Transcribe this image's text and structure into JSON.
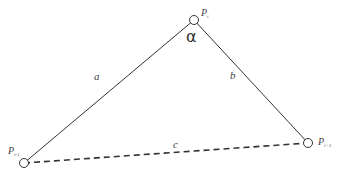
{
  "diagram": {
    "type": "triangle",
    "vertices": [
      {
        "id": "top",
        "label": "P",
        "subscript": "i",
        "x": 194,
        "y": 20
      },
      {
        "id": "left",
        "label": "P",
        "subscript": "i-1",
        "x": 24,
        "y": 163
      },
      {
        "id": "right",
        "label": "P",
        "subscript": "i+1",
        "x": 308,
        "y": 143
      }
    ],
    "edges": [
      {
        "id": "a",
        "label": "a",
        "from": "left",
        "to": "top",
        "style": "solid"
      },
      {
        "id": "b",
        "label": "b",
        "from": "top",
        "to": "right",
        "style": "solid"
      },
      {
        "id": "c",
        "label": "c",
        "from": "left",
        "to": "right",
        "style": "dashed"
      }
    ],
    "angle_label": "α",
    "colors": {
      "line": "#333333",
      "text": "#444444"
    }
  }
}
